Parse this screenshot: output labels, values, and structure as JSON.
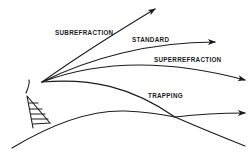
{
  "diagram": {
    "type": "radio-wave-refraction",
    "labels": {
      "subrefraction": "SUBREFRACTION",
      "standard": "STANDARD",
      "superrefraction": "SUPERREFRACTION",
      "trapping": "TRAPPING"
    },
    "elements": {
      "transmitter": "antenna-tower",
      "surface": "earth-curvature"
    },
    "colors": {
      "ink": "#1c1c1c",
      "background": "#ffffff"
    }
  }
}
